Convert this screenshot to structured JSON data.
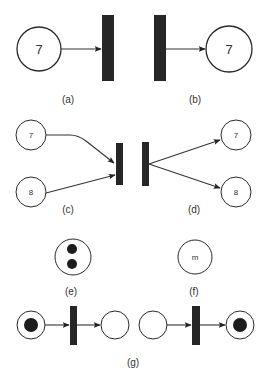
{
  "figure": {
    "panels": [
      {
        "id": "a",
        "caption": "(a)",
        "place_label": "7",
        "type": "input place to transition"
      },
      {
        "id": "b",
        "caption": "(b)",
        "place_label": "7",
        "type": "transition to output place"
      },
      {
        "id": "c",
        "caption": "(c)",
        "place_labels": [
          "7",
          "8"
        ],
        "type": "two input places to transition"
      },
      {
        "id": "d",
        "caption": "(d)",
        "place_labels": [
          "7",
          "8"
        ],
        "type": "transition to two output places"
      },
      {
        "id": "e",
        "caption": "(e)",
        "tokens": 2,
        "type": "place with two tokens"
      },
      {
        "id": "f",
        "caption": "(f)",
        "place_label": "m",
        "type": "place with m tokens"
      },
      {
        "id": "g",
        "caption": "(g)",
        "type": "transition firing: before and after"
      }
    ]
  },
  "colors": {
    "stroke": "#2a2a2a",
    "bar": "#262626",
    "token": "#1c1c1c",
    "background": "#ffffff"
  }
}
